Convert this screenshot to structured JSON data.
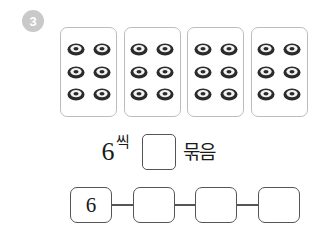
{
  "problem": {
    "number": "3",
    "badge_color": "#c9c9c9"
  },
  "cards": {
    "item_icon": "donut-icon",
    "items_per_card": 6,
    "rows_per_card": 3,
    "cols_per_card": 2,
    "list": [
      {
        "id": "card-1",
        "count": 6
      },
      {
        "id": "card-2",
        "count": 6
      },
      {
        "id": "card-3",
        "count": 6
      },
      {
        "id": "card-4",
        "count": 6
      }
    ]
  },
  "sentence": {
    "count_number": "6",
    "count_suffix": "씩",
    "answer_box_value": "",
    "groups_label": "묶음"
  },
  "chain": {
    "boxes": [
      {
        "id": "chain-box-1",
        "value": "6"
      },
      {
        "id": "chain-box-2",
        "value": ""
      },
      {
        "id": "chain-box-3",
        "value": ""
      },
      {
        "id": "chain-box-4",
        "value": ""
      }
    ]
  },
  "colors": {
    "box_border": "#555555",
    "card_border": "#bdbdbd",
    "text": "#1a1a1a",
    "donut_dark": "#2b2b2b",
    "donut_light": "#f2f2f2",
    "background": "#ffffff"
  }
}
